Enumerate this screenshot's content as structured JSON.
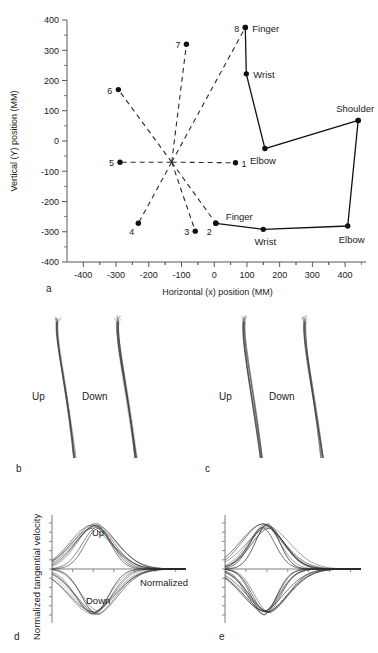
{
  "figure": {
    "panel_letters": {
      "a": "a",
      "b": "b",
      "c": "c",
      "d": "d",
      "e": "e"
    }
  },
  "chart_data": [
    {
      "id": "panel-a",
      "type": "scatter",
      "title": "",
      "xlabel": "Horizontal (x) position (MM)",
      "ylabel": "Vertical (Y) position (MM)",
      "xlim": [
        -450,
        470
      ],
      "ylim": [
        -400,
        400
      ],
      "xticks": [
        -400,
        -300,
        -200,
        -100,
        0,
        100,
        200,
        300,
        400
      ],
      "xticklabels": [
        "-400",
        "-300",
        "-200",
        "-100",
        "0",
        "100",
        "200",
        "300",
        "400"
      ],
      "yticks": [
        -400,
        -300,
        -200,
        -100,
        0,
        100,
        200,
        300,
        400
      ],
      "yticklabels": [
        "-400",
        "-300",
        "-200",
        "-100",
        "0",
        "100",
        "200",
        "300",
        "400"
      ],
      "grid": false,
      "center": {
        "x": -130,
        "y": -70
      },
      "targets": [
        {
          "label": "1",
          "x": 65,
          "y": -72,
          "label_side": "right"
        },
        {
          "label": "2",
          "x": 5,
          "y": -272,
          "label_side": "below-left"
        },
        {
          "label": "3",
          "x": -58,
          "y": -298,
          "label_side": "left"
        },
        {
          "label": "4",
          "x": -232,
          "y": -272,
          "label_side": "below-left"
        },
        {
          "label": "5",
          "x": -288,
          "y": -70,
          "label_side": "left"
        },
        {
          "label": "6",
          "x": -293,
          "y": 170,
          "label_side": "left"
        },
        {
          "label": "7",
          "x": -85,
          "y": 320,
          "label_side": "left"
        },
        {
          "label": "8",
          "x": 95,
          "y": 375,
          "label_side": "left"
        }
      ],
      "target_spokes": [
        {
          "from": "center",
          "to": "1"
        },
        {
          "from": "center",
          "to": "2"
        },
        {
          "from": "center",
          "to": "3"
        },
        {
          "from": "center",
          "to": "4"
        },
        {
          "from": "center",
          "to": "5"
        },
        {
          "from": "center",
          "to": "6"
        },
        {
          "from": "center",
          "to": "7"
        },
        {
          "from": "center",
          "to": "8"
        }
      ],
      "arm_postures": [
        {
          "name": "upper-posture",
          "joints": [
            {
              "label": "Finger",
              "x": 95,
              "y": 375,
              "label_side": "right"
            },
            {
              "label": "Wrist",
              "x": 98,
              "y": 222,
              "label_side": "right"
            },
            {
              "label": "Elbow",
              "x": 155,
              "y": -25,
              "label_side": "below"
            },
            {
              "label": "Shoulder",
              "x": 440,
              "y": 68,
              "label_side": "above"
            }
          ]
        },
        {
          "name": "lower-posture",
          "joints": [
            {
              "label": "Finger",
              "x": 5,
              "y": -272,
              "label_side": "above-right"
            },
            {
              "label": "Wrist",
              "x": 150,
              "y": -292,
              "label_side": "below"
            },
            {
              "label": "Elbow",
              "x": 408,
              "y": -281,
              "label_side": "below-right"
            },
            {
              "label": "Shoulder",
              "x": 440,
              "y": 68,
              "label_side": "none"
            }
          ]
        }
      ]
    },
    {
      "id": "panel-b",
      "type": "line",
      "title": "",
      "xlabel": "",
      "ylabel": "",
      "grid": false,
      "trace_groups": [
        {
          "name": "Up",
          "label": "Up",
          "n_traces": 9
        },
        {
          "name": "Down",
          "label": "Down",
          "n_traces": 9
        }
      ],
      "description": "Hand path bundles, slightly curved, vertical movements"
    },
    {
      "id": "panel-c",
      "type": "line",
      "title": "",
      "xlabel": "",
      "ylabel": "",
      "grid": false,
      "trace_groups": [
        {
          "name": "Up",
          "label": "Up",
          "n_traces": 9
        },
        {
          "name": "Down",
          "label": "Down",
          "n_traces": 9
        }
      ],
      "description": "Hand path bundles, slightly curved, vertical movements"
    },
    {
      "id": "panel-d",
      "type": "line",
      "title": "",
      "xlabel": "Normalized time",
      "ylabel": "Normalized tangential velocity",
      "xlim": [
        0,
        1
      ],
      "ylim": [
        -1.05,
        1.05
      ],
      "grid": false,
      "series": [
        {
          "name": "Up",
          "label": "Up",
          "peak": 1.0,
          "peak_time": 0.38,
          "n_traces": 9
        },
        {
          "name": "Down",
          "label": "Down",
          "peak": -1.0,
          "peak_time": 0.4,
          "n_traces": 9
        }
      ]
    },
    {
      "id": "panel-e",
      "type": "line",
      "title": "",
      "xlabel": "",
      "ylabel": "",
      "xlim": [
        0,
        1
      ],
      "ylim": [
        -1.05,
        1.05
      ],
      "grid": false,
      "series": [
        {
          "name": "Up",
          "label": "",
          "peak": 1.0,
          "peak_time": 0.36,
          "n_traces": 9
        },
        {
          "name": "Down",
          "label": "",
          "peak": -1.0,
          "peak_time": 0.39,
          "n_traces": 9
        }
      ]
    }
  ]
}
